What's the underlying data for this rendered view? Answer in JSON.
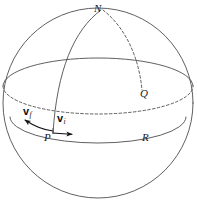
{
  "figure": {
    "background_color": "#ffffff",
    "stroke_color": "#4d4d4d",
    "label_color": "#1a1a1a",
    "width": 197,
    "height": 207
  },
  "labels": {
    "north_pole": "N",
    "point_q": "Q",
    "point_p": "P",
    "point_r": "R"
  },
  "vectors": [
    {
      "id": "v-final",
      "symbol": "v",
      "subscript": "f",
      "description": "final velocity vector at P, tangent pointing down-left"
    },
    {
      "id": "v-initial",
      "symbol": "v",
      "subscript": "i",
      "description": "initial velocity vector at P, tangent pointing right along latitude toward R"
    }
  ],
  "geometry": {
    "sphere": {
      "cx": 98,
      "cy": 103,
      "r": 95
    },
    "equator": {
      "cx": 98,
      "cy": 86,
      "rx": 95,
      "ry": 28,
      "back_half": "dashed",
      "front_half": "solid"
    },
    "latitude_through_p": {
      "cx": 98,
      "cy": 117,
      "rx": 88,
      "ry": 26,
      "front_half": "solid"
    },
    "meridian_n_to_p": {
      "style": "solid"
    },
    "meridian_n_to_q": {
      "style": "dashed"
    }
  }
}
